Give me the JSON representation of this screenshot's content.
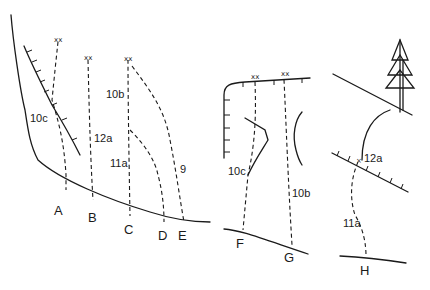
{
  "diagram": {
    "type": "climbing-route-topo",
    "panels": [
      {
        "id": "left",
        "routes": [
          {
            "letter": "A",
            "grade": "10c"
          },
          {
            "letter": "B",
            "grade": "12a"
          },
          {
            "letter": "C",
            "grade": "10b"
          },
          {
            "letter": "C-variation",
            "grade": "11a"
          },
          {
            "letter": "D",
            "grade": ""
          },
          {
            "letter": "E",
            "grade": "9"
          }
        ]
      },
      {
        "id": "middle",
        "routes": [
          {
            "letter": "F",
            "grade": "10c"
          },
          {
            "letter": "G",
            "grade": "10b"
          }
        ]
      },
      {
        "id": "right",
        "routes": [
          {
            "letter": "H",
            "grade": "11a"
          },
          {
            "letter": "H-roof",
            "grade": "12a"
          }
        ]
      }
    ],
    "labels": {
      "A": "A",
      "B": "B",
      "C": "C",
      "D": "D",
      "E": "E",
      "F": "F",
      "G": "G",
      "H": "H",
      "g10c_left": "10c",
      "g12a_left": "12a",
      "g10b_left": "10b",
      "g11a_left": "11a",
      "g9": "9",
      "g10c_mid": "10c",
      "g10b_mid": "10b",
      "g12a_right": "12a",
      "g11a_right": "11a",
      "anchor": "xx",
      "bolt": "×"
    }
  }
}
